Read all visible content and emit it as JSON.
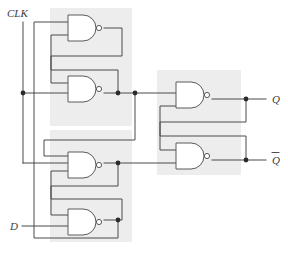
{
  "diagram": {
    "background_color": "#ffffff",
    "wire_color": "#4a4a4a",
    "gate_outline_color": "#5a5a5a",
    "shade_color": "#ededed",
    "junction_color": "#2b2b2b",
    "label_color": "#3d3d3d"
  },
  "inputs": [
    {
      "id": "clk",
      "label": "CLK",
      "x": 13,
      "y": 14
    },
    {
      "id": "d",
      "label": "D",
      "x": 13,
      "y": 227
    }
  ],
  "outputs": [
    {
      "id": "q",
      "label": "Q",
      "x": 272,
      "y": 99,
      "overbar": false
    },
    {
      "id": "qbar",
      "label": "Q",
      "x": 272,
      "y": 160,
      "overbar": true
    }
  ],
  "shaded_regions": [
    {
      "id": "left-upper-group",
      "x": 50,
      "y": 8,
      "width": 82,
      "height": 118
    },
    {
      "id": "left-lower-group",
      "x": 50,
      "y": 130,
      "width": 82,
      "height": 112
    },
    {
      "id": "right-output-latch",
      "x": 157,
      "y": 70,
      "width": 84,
      "height": 105
    }
  ],
  "gates": [
    {
      "id": "nand-1",
      "type": "NAND",
      "x": 68,
      "y": 15,
      "width": 30,
      "height": 26
    },
    {
      "id": "nand-2",
      "type": "NAND",
      "x": 68,
      "y": 76,
      "width": 30,
      "height": 26
    },
    {
      "id": "nand-3",
      "type": "NAND",
      "x": 68,
      "y": 152,
      "width": 30,
      "height": 26
    },
    {
      "id": "nand-4",
      "type": "NAND",
      "x": 68,
      "y": 209,
      "width": 30,
      "height": 26
    },
    {
      "id": "nand-5",
      "type": "NAND",
      "x": 176,
      "y": 82,
      "width": 30,
      "height": 26
    },
    {
      "id": "nand-6",
      "type": "NAND",
      "x": 176,
      "y": 143,
      "width": 30,
      "height": 26
    }
  ],
  "junctions": [
    {
      "id": "clk-branch-dot",
      "x": 23,
      "y": 93
    },
    {
      "id": "nand2-out-dot",
      "x": 118,
      "y": 93
    },
    {
      "id": "nand2-feed-dot",
      "x": 135,
      "y": 93
    },
    {
      "id": "nand3-out-dot",
      "x": 118,
      "y": 163
    },
    {
      "id": "nand4-out-dot",
      "x": 118,
      "y": 220
    },
    {
      "id": "q-out-dot",
      "x": 246,
      "y": 99
    },
    {
      "id": "qbar-out-dot",
      "x": 246,
      "y": 160
    }
  ],
  "nets": [
    {
      "id": "clk-trunk",
      "from": "CLK",
      "to": "nand-2 / nand-3 inputs"
    },
    {
      "id": "nand1-cross",
      "from": "nand-1 output",
      "to": "nand-2 lower input"
    },
    {
      "id": "nand2-cross",
      "from": "nand-2 output",
      "to": "nand-1 lower input"
    },
    {
      "id": "nand2-to-nand5",
      "from": "nand-2 output",
      "to": "nand-5 upper input"
    },
    {
      "id": "nand2-to-nand3",
      "from": "nand-2 output",
      "to": "nand-3 upper input"
    },
    {
      "id": "nand3-cross",
      "from": "nand-3 output",
      "to": "nand-4 upper input"
    },
    {
      "id": "nand4-cross",
      "from": "nand-4 output",
      "to": "nand-3 lower input"
    },
    {
      "id": "nand3-to-nand6",
      "from": "nand-3 output",
      "to": "nand-6 lower input"
    },
    {
      "id": "nand4-to-nand1",
      "from": "nand-4 output",
      "to": "nand-1 upper input"
    },
    {
      "id": "d-to-nand4",
      "from": "D",
      "to": "nand-4 lower input"
    },
    {
      "id": "nand5-cross",
      "from": "nand-5 output (Q)",
      "to": "nand-6 upper input"
    },
    {
      "id": "nand6-cross",
      "from": "nand-6 output (Qbar)",
      "to": "nand-5 lower input"
    },
    {
      "id": "q-net",
      "from": "nand-5 output",
      "to": "Q"
    },
    {
      "id": "qbar-net",
      "from": "nand-6 output",
      "to": "Qbar"
    }
  ]
}
